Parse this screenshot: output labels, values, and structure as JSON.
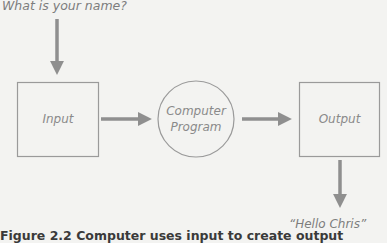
{
  "diagram": {
    "prompt_label": "What is your name?",
    "nodes": {
      "input": "Input",
      "program_line1": "Computer",
      "program_line2": "Program",
      "output": "Output"
    },
    "result_label": "“Hello Chris”",
    "caption": "Figure 2.2 Computer uses input to create output"
  },
  "colors": {
    "background": "#f3f3f1",
    "stroke": "#9a9a9a",
    "arrow": "#8f8f8f",
    "text": "#7d7d7d"
  }
}
